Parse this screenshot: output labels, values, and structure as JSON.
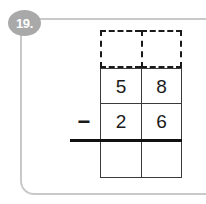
{
  "problem": {
    "number_label": "19.",
    "operator": "−",
    "operator_name": "minus-sign",
    "minuend": {
      "tens": "5",
      "ones": "8"
    },
    "subtrahend": {
      "tens": "2",
      "ones": "6"
    },
    "regroup_row": {
      "tens": "",
      "ones": ""
    },
    "answer_row": {
      "tens": "",
      "ones": ""
    }
  },
  "colors": {
    "frame_border": "#c9c9c9",
    "badge_background": "#a9a9a9",
    "badge_text": "#ffffff",
    "grid_line": "#3a3a3a",
    "dashed_line": "#1a1a1a",
    "answer_bar": "#111111",
    "digit_text": "#1a1a1a",
    "page_background": "#ffffff"
  }
}
